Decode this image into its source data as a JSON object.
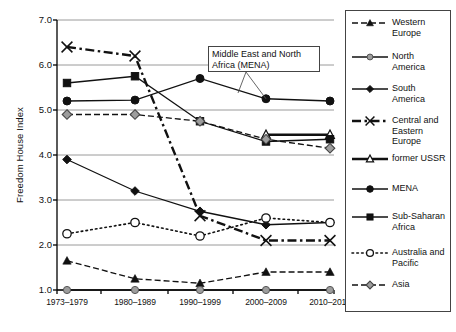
{
  "chart_data": {
    "type": "line",
    "title": "",
    "xlabel": "",
    "ylabel": "Freedom House Index",
    "categories": [
      "1973–1979",
      "1980–1989",
      "1990–1999",
      "2000–2009",
      "2010–2014"
    ],
    "ylim": [
      1.0,
      7.0
    ],
    "yticks": [
      "1.0",
      "2.0",
      "3.0",
      "4.0",
      "5.0",
      "6.0",
      "7.0"
    ],
    "grid": true,
    "legend_position": "right",
    "annotations": [
      {
        "text": "Middle East and North\nAfrica (MENA)",
        "target_series": "MENA"
      }
    ],
    "series": [
      {
        "name": "Western\nEurope",
        "legend_label": "Western\nEurope",
        "marker": "triangle-filled",
        "line": "dashed",
        "values": [
          1.65,
          1.25,
          1.15,
          1.4,
          1.4
        ]
      },
      {
        "name": "North\nAmerica",
        "legend_label": "North\nAmerica",
        "marker": "circle-gray",
        "line": "solid",
        "values": [
          1.0,
          1.0,
          1.0,
          1.0,
          1.0
        ]
      },
      {
        "name": "South\nAmerica",
        "legend_label": "South\nAmerica",
        "marker": "diamond-filled",
        "line": "solid",
        "values": [
          3.9,
          3.2,
          2.75,
          2.45,
          2.5
        ]
      },
      {
        "name": "Central and\nEastern Europe",
        "legend_label": "Central and\nEastern Europe",
        "marker": "x-cross",
        "line": "dash-dot",
        "values": [
          6.4,
          6.2,
          2.65,
          2.1,
          2.1
        ]
      },
      {
        "name": "former USSR",
        "legend_label": "former USSR",
        "marker": "triangle-open",
        "line": "solid-thick",
        "values": [
          null,
          null,
          null,
          4.45,
          4.45
        ]
      },
      {
        "name": "MENA",
        "legend_label": "MENA",
        "marker": "circle-filled",
        "line": "solid",
        "values": [
          5.2,
          5.22,
          5.7,
          5.25,
          5.2
        ]
      },
      {
        "name": "Sub-Saharan\nAfrica",
        "legend_label": "Sub-Saharan\nAfrica",
        "marker": "square-filled",
        "line": "solid",
        "values": [
          5.6,
          5.75,
          4.75,
          4.3,
          4.35
        ]
      },
      {
        "name": "Australia and\nPacific",
        "legend_label": "Australia and\nPacific",
        "marker": "circle-open",
        "line": "dotted",
        "values": [
          2.25,
          2.5,
          2.2,
          2.6,
          2.5
        ]
      },
      {
        "name": "Asia",
        "legend_label": "Asia",
        "marker": "diamond-gray",
        "line": "dashed",
        "values": [
          4.9,
          4.9,
          4.75,
          4.35,
          4.15
        ]
      }
    ]
  },
  "colors": {
    "axis": "#000000",
    "grid": "#9a9a9a",
    "line_dark": "#111111",
    "marker_gray": "#9d9d9d",
    "background": "#ffffff"
  },
  "legend": {
    "items": [
      {
        "label": "Western\nEurope"
      },
      {
        "label": "North\nAmerica"
      },
      {
        "label": "South\nAmerica"
      },
      {
        "label": "Central and\nEastern Europe"
      },
      {
        "label": "former USSR"
      },
      {
        "label": "MENA"
      },
      {
        "label": "Sub-Saharan\nAfrica"
      },
      {
        "label": "Australia and\nPacific"
      },
      {
        "label": "Asia"
      }
    ]
  }
}
